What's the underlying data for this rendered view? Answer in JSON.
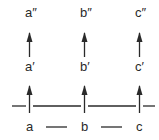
{
  "diagram": {
    "columns": [
      {
        "top": "a″",
        "middle": "a′",
        "bottom": "a",
        "x": 29
      },
      {
        "top": "b″",
        "middle": "b′",
        "bottom": "b",
        "x": 84
      },
      {
        "top": "c″",
        "middle": "c′",
        "bottom": "c",
        "x": 139
      }
    ],
    "connectors": [
      "—",
      "—"
    ],
    "arrow_direction": "up",
    "line_color": "#2a2a2a"
  }
}
